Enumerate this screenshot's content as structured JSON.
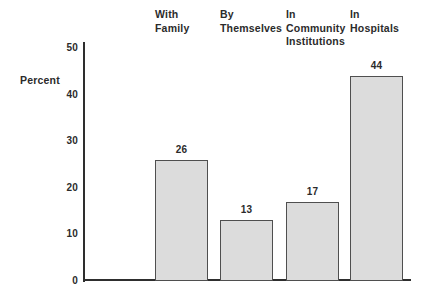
{
  "chart_data": {
    "type": "bar",
    "title": "",
    "ylabel": "Percent",
    "xlabel": "",
    "categories": [
      "With Family",
      "By Themselves",
      "In Community Institutions",
      "In Hospitals"
    ],
    "values": [
      26,
      13,
      17,
      44
    ],
    "yticks": [
      0,
      10,
      20,
      30,
      40,
      50
    ],
    "ylim": [
      0,
      50
    ],
    "grid": false,
    "legend": "none",
    "bar_fill_color": "#dcdcdc",
    "bar_border_color": "#4f4f4f",
    "axis_color": "#2e2e2e",
    "text_color": "#2b2b2b"
  }
}
